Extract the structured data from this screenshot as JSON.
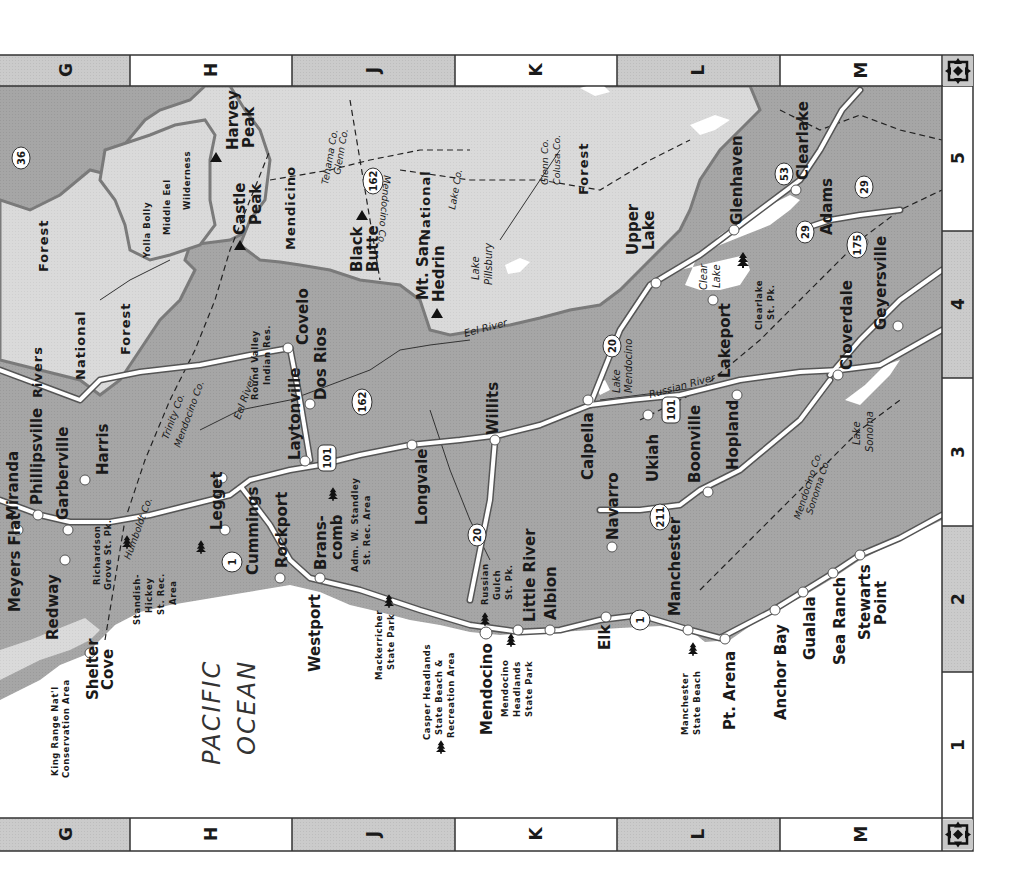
{
  "map": {
    "orientation": "rotated 90 degrees clockwise",
    "colors": {
      "ocean": "#ffffff",
      "land": "#a9a9a9",
      "national_forest": "#d9d9d9",
      "forest_border": "#7a7a7a",
      "road": "#ffffff",
      "road_edge": "#555555",
      "text": "#1a1a1a",
      "grid_shaded": "#c8c8c8",
      "grid_white": "#ffffff"
    },
    "grid": {
      "columns": [
        "G",
        "H",
        "J",
        "K",
        "L",
        "M"
      ],
      "rows": [
        "5",
        "4",
        "3",
        "2",
        "1"
      ],
      "compass_icon": "compass-rose-icon"
    },
    "ocean_label": [
      "PACIFIC",
      "OCEAN"
    ],
    "towns": {
      "meyers_flat": "Meyers Flat",
      "miranda": "Miranda",
      "phillipsville": "Phillipsville",
      "garberville": "Garberville",
      "redway": "Redway",
      "harris": "Harris",
      "shelter_cove": [
        "Shelter",
        "Cove"
      ],
      "legget": "Legget",
      "cummings": "Cummings",
      "rockport": "Rockport",
      "westport": "Westport",
      "branscomb": [
        "Brans-",
        "comb"
      ],
      "laytonville": "Laytonville",
      "dos_rios": "Dos Rios",
      "covelo": "Covelo",
      "longvale": "Longvale",
      "willits": "Willits",
      "little_river": "Little River",
      "albion": "Albion",
      "mendocino": "Mendocino",
      "elk": "Elk",
      "navarro": "Navarro",
      "calpella": "Calpella",
      "ukiah": "Ukiah",
      "boonville": "Boonville",
      "hopland": "Hopland",
      "manchester": "Manchester",
      "pt_arena": "Pt. Arena",
      "anchor_bay": "Anchor Bay",
      "gualala": "Gualala",
      "sea_ranch": "Sea Ranch",
      "stewarts_point": [
        "Stewarts",
        "Point"
      ],
      "lakeport": "Lakeport",
      "upper_lake": [
        "Upper",
        "Lake"
      ],
      "glenhaven": "Glenhaven",
      "clearlake": "Clearlake",
      "adams": "Adams",
      "cloverdale": "Cloverdale",
      "geyersville": "Geyersville"
    },
    "peaks": {
      "harvey_peak": [
        "Harvey",
        "Peak"
      ],
      "castle_peak": [
        "Castle",
        "Peak"
      ],
      "black_butte": [
        "Black",
        "Butte"
      ],
      "mt_san_hedrin": [
        "Mt. San",
        "Hedrin"
      ]
    },
    "forests": {
      "six_rivers": [
        "Rivers",
        "National",
        "Forest"
      ],
      "forest_top": "Forest",
      "mendocino_nf": [
        "Mendicino",
        "National",
        "Forest"
      ],
      "yolla_bolly": [
        "Yolla Bolly",
        "Middle Eel",
        "Wilderness"
      ]
    },
    "parks": {
      "king_range": [
        "King Range Nat'l",
        "Conservation Area"
      ],
      "richardson_grove": [
        "Richardson",
        "Grove St. Pk."
      ],
      "standish_hickey": [
        "Standish-",
        "Hickey",
        "St. Rec.",
        "Area"
      ],
      "standley": [
        "Adm. W. Standley",
        "St. Rec. Area"
      ],
      "mackerricher": [
        "Mackerricher",
        "State Park"
      ],
      "casper_headlands": [
        "Casper Headlands",
        "State Beach &",
        "Recreation Area"
      ],
      "russian_gulch": [
        "Russian",
        "Gulch",
        "St. Pk."
      ],
      "mendocino_headlands": [
        "Mendocino",
        "Headlands",
        "State Park"
      ],
      "manchester_beach": [
        "Manchester",
        "State Beach"
      ],
      "clearlake_sp": [
        "Clearlake",
        "St. Pk."
      ]
    },
    "water": {
      "eel_river": "Eel River",
      "eel_river_2": "Eel River",
      "russian_river": "Russian River",
      "lake_mendocino": [
        "Lake",
        "Mendocino"
      ],
      "lake_pillsbury": [
        "Lake",
        "Pillsbury"
      ],
      "lake_sonoma": [
        "Lake",
        "Sonoma"
      ],
      "clear_lake": [
        "Clear",
        "Lake"
      ],
      "round_valley": [
        "Round Valley",
        "Indian Res."
      ]
    },
    "counties": {
      "humboldt": "Humboldt Co.",
      "trinity_mendo": [
        "Trinity Co.",
        "Mendocino Co."
      ],
      "tehama_glenn": [
        "Tehama Co.",
        "Glenn Co."
      ],
      "mendo_lake": [
        "Mendocino Co.",
        "Lake Co."
      ],
      "glenn_colusa": [
        "Glenn Co.",
        "Colusa Co."
      ],
      "mendo_sonoma": [
        "Mendocino Co.",
        "Sonoma Co."
      ]
    },
    "shields": {
      "r36": "36",
      "r1a": "1",
      "r1b": "1",
      "r101a": "101",
      "r101b": "101",
      "r162a": "162",
      "r162b": "162",
      "r20a": "20",
      "r20b": "20",
      "r211": "211",
      "r53": "53",
      "r29a": "29",
      "r29b": "29",
      "r175": "175"
    }
  }
}
